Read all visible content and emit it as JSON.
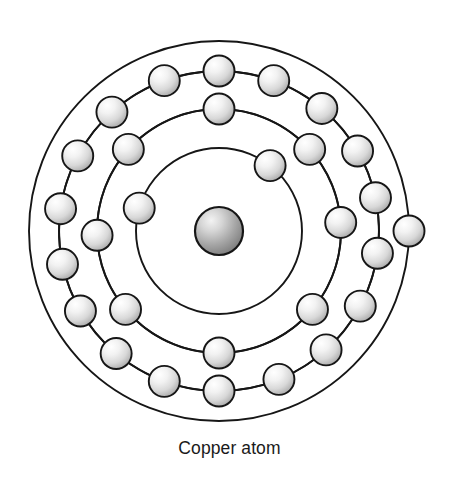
{
  "figure": {
    "title": "Copper atom",
    "caption": "Copper atom",
    "element_symbol": "Cu",
    "atomic_number": 29,
    "total_electrons": 29,
    "background_color": "#ffffff",
    "line_color": "#161616",
    "nucleus_color_light": "#e8e8e8",
    "nucleus_color_dark": "#7d7d7d",
    "electron_color_light": "#fafafa",
    "electron_color_dark": "#9e9e9e"
  },
  "geometry": {
    "width": 459,
    "height": 481,
    "center_x": 219,
    "center_y": 231,
    "nucleus_radius": 24,
    "electron_radius": 15.5
  },
  "nucleus": {
    "label": "nucleus",
    "radius": 24
  },
  "shells": [
    {
      "name": "K",
      "index": 1,
      "radius": 83,
      "electron_count": 2,
      "angles": [
        -52,
        196
      ]
    },
    {
      "name": "L",
      "index": 2,
      "radius": 122,
      "electron_count": 8,
      "angles": [
        -90,
        -42,
        -4,
        40,
        90,
        140,
        178,
        222
      ]
    },
    {
      "name": "M",
      "index": 3,
      "radius": 160,
      "electron_count": 18,
      "angles": [
        -90,
        -70,
        -50,
        -30,
        -12,
        8,
        28,
        48,
        68,
        90,
        110,
        130,
        150,
        168,
        188,
        208,
        228,
        250
      ]
    },
    {
      "name": "N",
      "index": 4,
      "radius": 190,
      "electron_count": 1,
      "angles": [
        0
      ]
    }
  ],
  "chart_data": {
    "type": "diagram",
    "title": "Copper atom",
    "element": "Copper",
    "symbol": "Cu",
    "atomic_number": 29,
    "shell_names": [
      "K",
      "L",
      "M",
      "N"
    ],
    "shell_radii": [
      83,
      122,
      160,
      190
    ],
    "electrons_per_shell": [
      2,
      8,
      18,
      1
    ],
    "electron_configuration": "2, 8, 18, 1",
    "nucleus_radius": 24,
    "legend": [],
    "xlabel": "",
    "ylabel": ""
  }
}
